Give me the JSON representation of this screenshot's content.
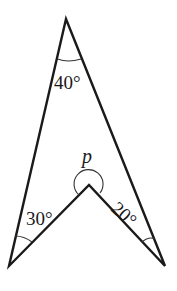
{
  "figure": {
    "type": "geometry-diagram",
    "shape": "arrowhead (concave quadrilateral)",
    "vertices": {
      "apex": [
        66,
        19
      ],
      "left_foot": [
        9,
        266
      ],
      "reflex": [
        89,
        185
      ],
      "right_foot": [
        165,
        266
      ]
    },
    "angles": [
      {
        "id": "apex",
        "label": "40°",
        "vertex": "apex"
      },
      {
        "id": "left_foot",
        "label": "30°",
        "vertex": "left_foot"
      },
      {
        "id": "right_foot",
        "label": "20°",
        "vertex": "right_foot"
      },
      {
        "id": "reflex",
        "label": "p",
        "vertex": "reflex",
        "reflex": true
      }
    ],
    "colors": {
      "line": "#1a1a1a",
      "background": "#ffffff"
    }
  }
}
